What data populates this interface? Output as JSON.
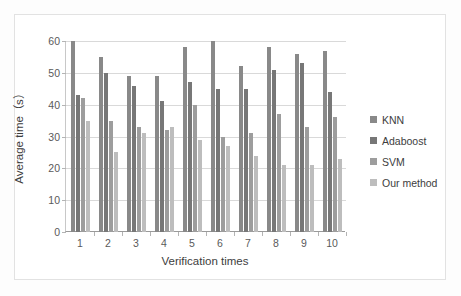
{
  "chart_data": {
    "type": "bar",
    "title": "",
    "xlabel": "Verification times",
    "ylabel": "Average time（s）",
    "categories": [
      "1",
      "2",
      "3",
      "4",
      "5",
      "6",
      "7",
      "8",
      "9",
      "10"
    ],
    "series": [
      {
        "name": "KNN",
        "color": "#898989",
        "values": [
          60,
          55,
          49,
          49,
          58,
          60,
          52,
          58,
          56,
          57
        ]
      },
      {
        "name": "Adaboost",
        "color": "#777777",
        "values": [
          43,
          50,
          46,
          41,
          47,
          45,
          45,
          51,
          53,
          44
        ]
      },
      {
        "name": "SVM",
        "color": "#9d9d9d",
        "values": [
          42,
          35,
          33,
          32,
          40,
          30,
          31,
          37,
          33,
          36
        ]
      },
      {
        "name": "Our method",
        "color": "#bdbdbd",
        "values": [
          35,
          25,
          31,
          33,
          29,
          27,
          24,
          21,
          21,
          23
        ]
      }
    ],
    "ylim": [
      0,
      60
    ],
    "yticks": [
      0,
      10,
      20,
      30,
      40,
      50,
      60
    ],
    "ytick_labels": [
      "0",
      "10",
      "20",
      "30",
      "40",
      "50",
      "60"
    ],
    "grid": "horizontal",
    "legend_position": "right",
    "legend_entries": [
      "KNN",
      "Adaboost",
      "SVM",
      "Our method"
    ]
  }
}
